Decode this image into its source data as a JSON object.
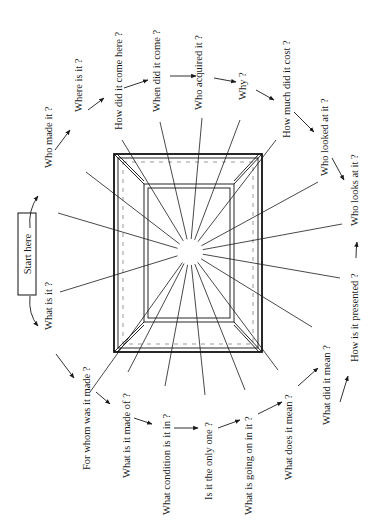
{
  "diagram": {
    "start_label": "Start here",
    "center": {
      "x": 190,
      "y": 252
    },
    "frame": {
      "outer": {
        "x1": 114,
        "y1": 154,
        "x2": 262,
        "y2": 352
      },
      "inner": {
        "x1": 148,
        "y1": 188,
        "x2": 230,
        "y2": 318
      }
    },
    "questions": [
      {
        "id": "what-is-it",
        "text": "What is it ?",
        "x": 52,
        "y": 330,
        "ray": [
          60,
          292
        ]
      },
      {
        "id": "who-made-it",
        "text": "Who made it ?",
        "x": 52,
        "y": 168,
        "ray": [
          58,
          213
        ]
      },
      {
        "id": "where-is-it",
        "text": "Where is it ?",
        "x": 82,
        "y": 112,
        "ray": [
          86,
          172
        ]
      },
      {
        "id": "how-did-it-come-here",
        "text": "How did it come here ?",
        "x": 122,
        "y": 130,
        "ray": [
          122,
          140
        ]
      },
      {
        "id": "when-did-it-come",
        "text": "When did it come ?",
        "x": 160,
        "y": 112,
        "ray": [
          160,
          122
        ]
      },
      {
        "id": "who-acquired-it",
        "text": "Who acquired it ?",
        "x": 202,
        "y": 110,
        "ray": [
          202,
          118
        ]
      },
      {
        "id": "why",
        "text": "Why ?",
        "x": 246,
        "y": 100,
        "ray": [
          240,
          120
        ]
      },
      {
        "id": "how-much-did-it-cost",
        "text": "How much did it cost ?",
        "x": 290,
        "y": 138,
        "ray": [
          276,
          140
        ]
      },
      {
        "id": "who-looked-at-it",
        "text": "Who looked at it ?",
        "x": 328,
        "y": 176,
        "ray": [
          318,
          182
        ]
      },
      {
        "id": "who-looks-at-it",
        "text": "Who looks at it ?",
        "x": 358,
        "y": 226,
        "ray": [
          342,
          224
        ]
      },
      {
        "id": "how-is-it-presented",
        "text": "How is it presented ?",
        "x": 358,
        "y": 362,
        "ray": [
          340,
          278
        ]
      },
      {
        "id": "what-did-it-mean",
        "text": "What did it mean ?",
        "x": 330,
        "y": 425,
        "ray": [
          312,
          327
        ]
      },
      {
        "id": "what-does-it-mean",
        "text": "What does it mean ?",
        "x": 292,
        "y": 480,
        "ray": [
          278,
          370
        ]
      },
      {
        "id": "what-is-going-on-in-it",
        "text": "What is going on in it ?",
        "x": 252,
        "y": 515,
        "ray": [
          245,
          390
        ]
      },
      {
        "id": "is-it-the-only-one",
        "text": "Is it the only one ?",
        "x": 212,
        "y": 500,
        "ray": [
          205,
          395
        ]
      },
      {
        "id": "what-condition-is-it-in",
        "text": "What condition is it in ?",
        "x": 170,
        "y": 515,
        "ray": [
          165,
          386
        ]
      },
      {
        "id": "what-is-it-made-of",
        "text": "What is it made of ?",
        "x": 130,
        "y": 478,
        "ray": [
          128,
          372
        ]
      },
      {
        "id": "for-whom-was-it-made",
        "text": "For whom was it made ?",
        "x": 90,
        "y": 470,
        "ray": [
          90,
          392
        ]
      }
    ],
    "arrows": [
      {
        "from": [
          30,
          228
        ],
        "to": [
          38,
          196
        ],
        "curve": [
          28,
          210
        ]
      },
      {
        "from": [
          30,
          296
        ],
        "to": [
          38,
          326
        ],
        "curve": [
          28,
          314
        ]
      },
      {
        "from": [
          55,
          150
        ],
        "to": [
          70,
          130
        ]
      },
      {
        "from": [
          88,
          110
        ],
        "to": [
          104,
          98
        ]
      },
      {
        "from": [
          124,
          88
        ],
        "to": [
          148,
          80
        ]
      },
      {
        "from": [
          170,
          76
        ],
        "to": [
          196,
          76
        ]
      },
      {
        "from": [
          214,
          78
        ],
        "to": [
          236,
          82
        ]
      },
      {
        "from": [
          256,
          90
        ],
        "to": [
          274,
          100
        ]
      },
      {
        "from": [
          294,
          112
        ],
        "to": [
          314,
          132
        ]
      },
      {
        "from": [
          332,
          158
        ],
        "to": [
          344,
          180
        ]
      },
      {
        "from": [
          356,
          258
        ],
        "to": [
          357,
          242
        ],
        "curve": [
          356,
          250
        ]
      },
      {
        "from": [
          340,
          402
        ],
        "to": [
          348,
          376
        ]
      },
      {
        "from": [
          298,
          386
        ],
        "to": [
          318,
          368
        ]
      },
      {
        "from": [
          258,
          414
        ],
        "to": [
          282,
          402
        ]
      },
      {
        "from": [
          218,
          428
        ],
        "to": [
          240,
          420
        ]
      },
      {
        "from": [
          174,
          428
        ],
        "to": [
          198,
          428
        ]
      },
      {
        "from": [
          134,
          418
        ],
        "to": [
          152,
          424
        ]
      },
      {
        "from": [
          96,
          392
        ],
        "to": [
          110,
          404
        ]
      },
      {
        "from": [
          56,
          354
        ],
        "to": [
          74,
          378
        ]
      }
    ]
  }
}
